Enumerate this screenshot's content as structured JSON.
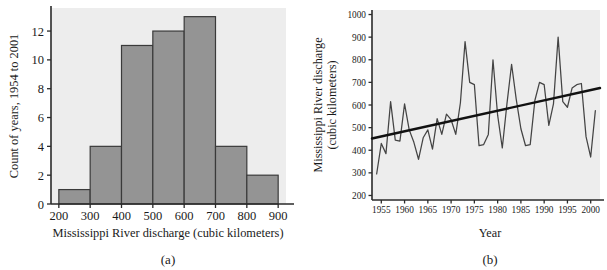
{
  "figure": {
    "panels": [
      {
        "caption": "(a)",
        "chart_data": {
          "type": "bar",
          "title": "",
          "xlabel": "Mississippi River discharge (cubic kilometers)",
          "ylabel": "Count of years, 1954 to 2001",
          "categories": [
            "200-300",
            "300-400",
            "400-500",
            "500-600",
            "600-700",
            "700-800",
            "800-900"
          ],
          "bin_edges": [
            200,
            300,
            400,
            500,
            600,
            700,
            800,
            900
          ],
          "values": [
            1,
            4,
            11,
            12,
            13,
            4,
            2
          ],
          "xlim": [
            175,
            925
          ],
          "ylim": [
            0,
            13.6
          ],
          "xticks": [
            200,
            300,
            400,
            500,
            600,
            700,
            800,
            900
          ],
          "xticklabels": [
            "200",
            "300",
            "400",
            "500",
            "600",
            "700",
            "800",
            "900"
          ],
          "yticks": [
            0,
            2,
            4,
            6,
            8,
            10,
            12
          ],
          "yticklabels": [
            "0",
            "2",
            "4",
            "6",
            "8",
            "10",
            "12"
          ],
          "grid": false,
          "legend": "none",
          "bar_color": "#949494",
          "bar_edge_color": "#3a3a3a",
          "plot_bg": "#ededed"
        }
      },
      {
        "caption": "(b)",
        "chart_data": {
          "type": "line",
          "title": "",
          "xlabel": "Year",
          "ylabel": "Mississippi River discharge (cubic kilometers)",
          "ylabel_line1": "Mississippi River discharge",
          "ylabel_line2": "(cubic kilometers)",
          "xlim": [
            1953,
            2002
          ],
          "ylim": [
            180,
            1020
          ],
          "xticks": [
            1955,
            1960,
            1965,
            1970,
            1975,
            1980,
            1985,
            1990,
            1995,
            2000
          ],
          "xticklabels": [
            "1955",
            "1960",
            "1965",
            "1970",
            "1975",
            "1980",
            "1985",
            "1990",
            "1995",
            "2000"
          ],
          "yticks": [
            200,
            300,
            400,
            500,
            600,
            700,
            800,
            900,
            1000
          ],
          "yticklabels": [
            "200",
            "300",
            "400",
            "500",
            "600",
            "700",
            "800",
            "900",
            "1000"
          ],
          "grid": false,
          "legend": "none",
          "line_color": "#444444",
          "trend_color": "#111111",
          "plot_bg": "#ededed",
          "x": [
            1954,
            1955,
            1956,
            1957,
            1958,
            1959,
            1960,
            1961,
            1962,
            1963,
            1964,
            1965,
            1966,
            1967,
            1968,
            1969,
            1970,
            1971,
            1972,
            1973,
            1974,
            1975,
            1976,
            1977,
            1978,
            1979,
            1980,
            1981,
            1982,
            1983,
            1984,
            1985,
            1986,
            1987,
            1988,
            1989,
            1990,
            1991,
            1992,
            1993,
            1994,
            1995,
            1996,
            1997,
            1998,
            1999,
            2000,
            2001
          ],
          "series": [
            {
              "name": "Annual discharge",
              "values": [
                295,
                430,
                385,
                615,
                445,
                440,
                605,
                490,
                435,
                360,
                455,
                490,
                405,
                540,
                470,
                560,
                535,
                470,
                610,
                880,
                700,
                690,
                420,
                425,
                470,
                800,
                555,
                410,
                605,
                780,
                625,
                495,
                420,
                425,
                620,
                700,
                690,
                510,
                605,
                900,
                615,
                590,
                675,
                690,
                695,
                460,
                370,
                575
              ]
            }
          ],
          "trendline": {
            "name": "Linear trend",
            "x": [
              1953,
              2002
            ],
            "y": [
              452,
              675
            ]
          }
        }
      }
    ]
  }
}
